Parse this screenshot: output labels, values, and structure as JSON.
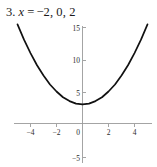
{
  "problem": {
    "number": "3.",
    "variable": "x",
    "equals": "=",
    "values": "−2, 0, 2",
    "full_text": "3. x = −2, 0, 2"
  },
  "colors": {
    "curve": "#111111",
    "axis": "#9a9a9a",
    "text": "#1a1a1a",
    "background": "#ffffff"
  },
  "chart_data": {
    "type": "line",
    "title": "",
    "xlabel": "",
    "ylabel": "",
    "xlim": [
      -5.3,
      5.5
    ],
    "ylim": [
      -5.8,
      15.8
    ],
    "grid": false,
    "legend": null,
    "xticks": [
      -4,
      -2,
      0,
      2,
      4
    ],
    "xticklabels": [
      "−4",
      "−2",
      "0",
      "2",
      "4"
    ],
    "yticks": [
      15,
      10,
      5,
      -5
    ],
    "yticklabels": [
      "15",
      "10",
      "5",
      "−5"
    ],
    "axes_style": "crossed-at-origin",
    "series": [
      {
        "name": "parabola",
        "equation": "y = 0.5x^2 + 3",
        "vertex": [
          0,
          3
        ],
        "x": [
          -5,
          -4.5,
          -4,
          -3.5,
          -3,
          -2.5,
          -2,
          -1.5,
          -1,
          -0.5,
          0,
          0.5,
          1,
          1.5,
          2,
          2.5,
          3,
          3.5,
          4,
          4.5,
          5
        ],
        "values": [
          15.5,
          13.1,
          11,
          9.1,
          7.5,
          6.1,
          5,
          4.1,
          3.5,
          3.1,
          3,
          3.1,
          3.5,
          4.1,
          5,
          6.1,
          7.5,
          9.1,
          11,
          13.1,
          15.5
        ]
      }
    ]
  }
}
